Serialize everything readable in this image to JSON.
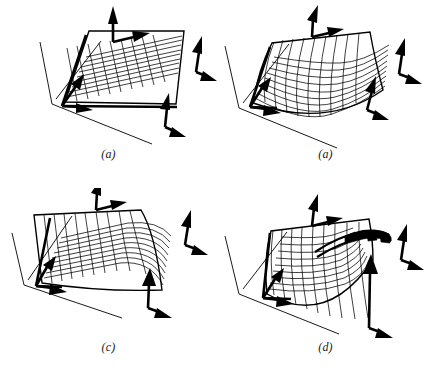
{
  "figure": {
    "background_color": "#ffffff",
    "ink_color": "#000000",
    "width": 434,
    "height": 377,
    "panel_count": 4,
    "layout": "2x2"
  },
  "panels": [
    {
      "id": "a",
      "label": "(a)",
      "position": "top-left",
      "surface_state": "flat undeformed grid",
      "mesh_rows": 10,
      "mesh_cols": 10,
      "arrow_groups": [
        {
          "name": "top-axis-indicator",
          "arrows": [
            "up",
            "right"
          ]
        },
        {
          "name": "right-axis-indicator",
          "arrows": [
            "up",
            "down-right"
          ]
        },
        {
          "name": "left-corner-constraint",
          "arrows": [
            "up-right",
            "right"
          ]
        },
        {
          "name": "bottom-right-constraint",
          "arrows": [
            "up",
            "down-right"
          ]
        }
      ]
    },
    {
      "id": "b",
      "label": "(a)",
      "position": "top-right",
      "surface_state": "saddle deformation, front edge sagging",
      "mesh_rows": 10,
      "mesh_cols": 10,
      "arrow_groups": [
        {
          "name": "top-axis-indicator",
          "arrows": [
            "up",
            "right"
          ]
        },
        {
          "name": "right-axis-indicator",
          "arrows": [
            "up",
            "down-right"
          ]
        },
        {
          "name": "left-corner-constraint",
          "arrows": [
            "up-right",
            "right"
          ]
        },
        {
          "name": "bottom-right-constraint",
          "arrows": [
            "up",
            "down-right"
          ]
        }
      ]
    },
    {
      "id": "c",
      "label": "(c)",
      "position": "bottom-left",
      "surface_state": "right edge bent steeply downward",
      "mesh_rows": 10,
      "mesh_cols": 10,
      "arrow_groups": [
        {
          "name": "top-axis-indicator",
          "arrows": [
            "up",
            "right"
          ]
        },
        {
          "name": "right-axis-indicator",
          "arrows": [
            "up",
            "down-right"
          ]
        },
        {
          "name": "left-corner-constraint",
          "arrows": [
            "up-right",
            "right"
          ]
        },
        {
          "name": "bottom-right-constraint",
          "arrows": [
            "up",
            "down-right"
          ]
        }
      ]
    },
    {
      "id": "d",
      "label": "(d)",
      "position": "bottom-right",
      "surface_state": "strongly folded with dark crease at upper-right corner",
      "mesh_rows": 10,
      "mesh_cols": 10,
      "arrow_groups": [
        {
          "name": "top-axis-indicator",
          "arrows": [
            "up",
            "right"
          ]
        },
        {
          "name": "right-axis-indicator",
          "arrows": [
            "up",
            "down-right"
          ]
        },
        {
          "name": "left-corner-constraint",
          "arrows": [
            "up-right",
            "right"
          ]
        },
        {
          "name": "bottom-right-constraint",
          "arrows": [
            "up",
            "down-right"
          ]
        }
      ]
    }
  ]
}
